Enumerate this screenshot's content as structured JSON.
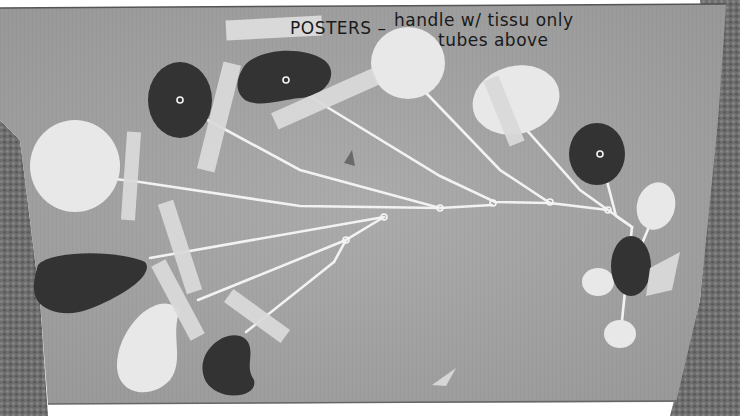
{
  "photo": {
    "subject": "Mobile sculpture parts taped to cardboard",
    "colors": {
      "cardboard": "#a9a9a9",
      "cardboard_dark": "#8f8f8f",
      "carpet": "#6b6b6b",
      "dark_shape": "#333333",
      "light_shape": "#e8e8e8",
      "wire": "#f2f2f2",
      "tape": "#dcdcdc"
    },
    "handwritten_note": {
      "line1_prefix": "POSTERS –",
      "line1_rest": "handle w/ tissu only",
      "line2": "tubes above"
    }
  }
}
